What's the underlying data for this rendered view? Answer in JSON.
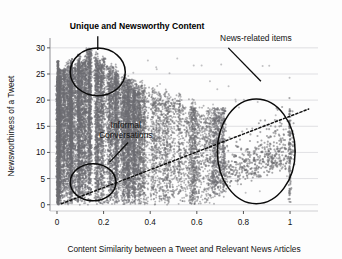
{
  "chart_data": {
    "type": "scatter",
    "title": "",
    "xlabel": "Content Similarity between a Tweet and Relevant News Articles",
    "ylabel": "Newsworthiness of a Tweet",
    "xlim": [
      -0.03,
      1.12
    ],
    "ylim": [
      -1.2,
      31.5
    ],
    "xticks": [
      "0",
      "0.2",
      "0.4",
      "0.6",
      "0.8",
      "1"
    ],
    "xtick_values": [
      0,
      0.2,
      0.4,
      0.6,
      0.8,
      1
    ],
    "yticks": [
      "0",
      "5",
      "10",
      "15",
      "20",
      "25",
      "30"
    ],
    "ytick_values": [
      0,
      5,
      10,
      15,
      20,
      25,
      30
    ],
    "grid": "horizontal",
    "legend": "none",
    "point_color": "#6e6e72",
    "point_opacity": 0.55,
    "trendline": {
      "style": "dotted",
      "color": "#111111",
      "x_start": 0.02,
      "y_start": 0.2,
      "x_end": 1.08,
      "y_end": 18.3
    },
    "annotations": [
      {
        "id": "unique-newsworthy",
        "text": "Unique and Newsworthy Content",
        "bold": true,
        "text_x": 0.055,
        "text_y": 33.6,
        "leader_from": [
          0.175,
          32.2
        ],
        "leader_to": [
          0.175,
          29.6
        ],
        "marker": {
          "shape": "circle",
          "cx": 0.175,
          "cy": 25.4,
          "rx": 0.118,
          "ry": 4.55
        }
      },
      {
        "id": "informal-conversations",
        "text": "Informal Conversations",
        "line1": "Informal",
        "line2": "Conversations",
        "bold": false,
        "text_x": 0.295,
        "text_y": 14.6,
        "leader_from": [
          0.305,
          11.9
        ],
        "leader_to": [
          0.225,
          8.1
        ],
        "marker": {
          "shape": "ellipse",
          "cx": 0.155,
          "cy": 4.3,
          "rx": 0.098,
          "ry": 3.55
        }
      },
      {
        "id": "news-related-items",
        "text": "News-related items",
        "bold": false,
        "text_x": 0.7,
        "text_y": 31.4,
        "leader_from": [
          0.735,
          30.0
        ],
        "leader_to": [
          0.875,
          23.6
        ],
        "marker": {
          "shape": "ellipse",
          "cx": 0.855,
          "cy": 10.2,
          "rx": 0.167,
          "ry": 10.0
        }
      }
    ]
  }
}
